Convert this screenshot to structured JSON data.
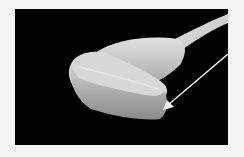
{
  "image": {
    "subject": "ultrasound-transducer-probe",
    "background_color": "#000000",
    "frame_color": "#f4f4f4",
    "annotation": {
      "type": "arrow",
      "color": "#f0f0f0",
      "points_to": "probe-tip"
    }
  }
}
